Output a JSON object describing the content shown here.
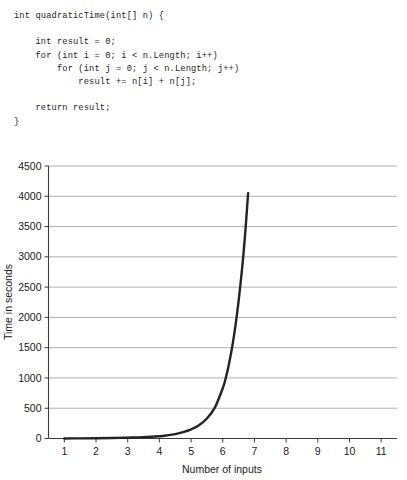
{
  "code": {
    "language": "csharp",
    "lines": [
      "int quadraticTime(int[] n) {",
      "",
      "    int result = 0;",
      "    for (int i = 0; i < n.Length; i++)",
      "        for (int j = 0; j < n.Length; j++)",
      "            result += n[i] + n[j];",
      "",
      "    return result;",
      "}"
    ]
  },
  "chart_data": {
    "type": "line",
    "title": "",
    "xlabel": "Number of inputs",
    "ylabel": "Time in seconds",
    "xlim": [
      0.5,
      11.5
    ],
    "ylim": [
      0,
      4500
    ],
    "xticks": [
      1,
      2,
      3,
      4,
      5,
      6,
      7,
      8,
      9,
      10,
      11
    ],
    "xtick_labels": [
      "1",
      "2",
      "3",
      "4",
      "5",
      "6",
      "7",
      "8",
      "9",
      "10",
      "11"
    ],
    "yticks": [
      0,
      500,
      1000,
      1500,
      2000,
      2500,
      3000,
      3500,
      4000,
      4500
    ],
    "ytick_labels": [
      "0",
      "500",
      "1000",
      "1500",
      "2000",
      "2500",
      "3000",
      "3500",
      "4000",
      "4500"
    ],
    "grid": "horizontal",
    "legend": "none",
    "series": [
      {
        "name": "quadraticTime",
        "color": "#232323",
        "x": [
          1.0,
          1.5,
          2.0,
          2.5,
          3.0,
          3.5,
          4.0,
          4.25,
          4.5,
          4.75,
          5.0,
          5.25,
          5.5,
          5.75,
          6.0,
          6.1,
          6.2,
          6.3,
          6.4,
          6.5,
          6.6,
          6.7,
          6.8
        ],
        "y": [
          1,
          2,
          4,
          8,
          14,
          22,
          38,
          52,
          72,
          104,
          150,
          220,
          330,
          510,
          830,
          1010,
          1240,
          1520,
          1860,
          2270,
          2750,
          3330,
          4050
        ]
      }
    ]
  }
}
